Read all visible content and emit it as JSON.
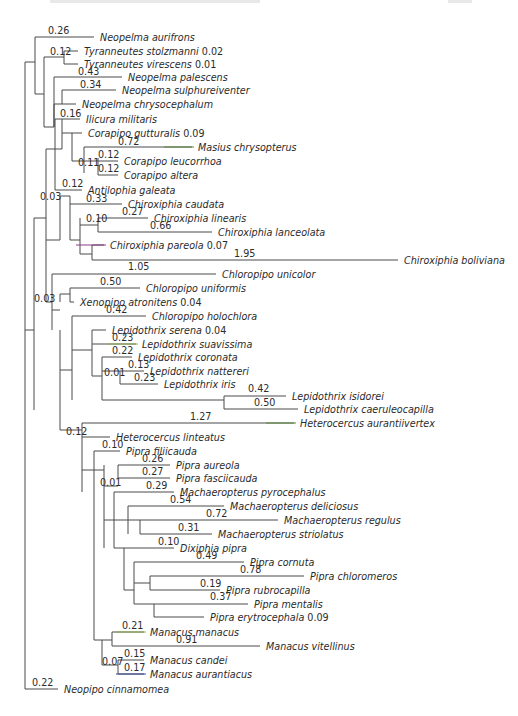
{
  "figure": {
    "type": "phylogenetic-tree",
    "colors": {
      "branch": "#4a4a4a",
      "text": "#2b2b2b",
      "green": "#5a8a3a",
      "purple": "#8a3a8a",
      "lime": "#8ab04a",
      "blue": "#3a4a9a"
    },
    "taxa": [
      {
        "id": "t1",
        "name": "Neopelma aurifrons",
        "x": 96,
        "y": 37,
        "label": "0.26",
        "lx": 48,
        "ly": 34
      },
      {
        "id": "t2",
        "name": "Tyranneutes stolzmanni",
        "x": 80,
        "y": 51,
        "suffix": "0.02",
        "label": "0.12",
        "lx": 50,
        "ly": 55
      },
      {
        "id": "t3",
        "name": "Tyranneutes virescens",
        "x": 80,
        "y": 64,
        "suffix": "0.01"
      },
      {
        "id": "t4",
        "name": "Neopelma palescens",
        "x": 124,
        "y": 77,
        "label": "0.43",
        "lx": 78,
        "ly": 75
      },
      {
        "id": "t5",
        "name": "Neopelma sulphureiventer",
        "x": 118,
        "y": 90,
        "label": "0.34",
        "lx": 80,
        "ly": 88
      },
      {
        "id": "t6",
        "name": "Neopelma chrysocephalum",
        "x": 78,
        "y": 104
      },
      {
        "id": "t7",
        "name": "Ilicura militaris",
        "x": 82,
        "y": 119,
        "label": "0.16",
        "lx": 60,
        "ly": 117
      },
      {
        "id": "t8",
        "name": "Corapipo gutturalis",
        "x": 84,
        "y": 133,
        "suffix": "0.09"
      },
      {
        "id": "t9",
        "name": "Masius chrysopterus",
        "x": 194,
        "y": 147,
        "label": "0.72",
        "lx": 118,
        "ly": 145,
        "color": "green"
      },
      {
        "id": "t10",
        "name": "Corapipo leucorrhoa",
        "x": 120,
        "y": 161,
        "label": "0.12",
        "lx": 98,
        "ly": 158
      },
      {
        "id": "t11",
        "name": "Corapipo altera",
        "x": 120,
        "y": 175,
        "label": "0.12",
        "lx": 98,
        "ly": 172
      },
      {
        "id": "t12",
        "name": "Antilophia galeata",
        "x": 84,
        "y": 190,
        "label": "0.12",
        "lx": 62,
        "ly": 187
      },
      {
        "id": "t13",
        "name": "Chiroxiphia caudata",
        "x": 124,
        "y": 204,
        "label": "0.33",
        "lx": 86,
        "ly": 202
      },
      {
        "id": "t14",
        "name": "Chiroxiphia linearis",
        "x": 150,
        "y": 218,
        "label": "0.27",
        "lx": 122,
        "ly": 215
      },
      {
        "id": "t15",
        "name": "Chiroxiphia lanceolata",
        "x": 214,
        "y": 232,
        "label": "0.66",
        "lx": 150,
        "ly": 229
      },
      {
        "id": "t16",
        "name": "Chiroxiphia pareola",
        "x": 106,
        "y": 245,
        "suffix": "0.07",
        "color": "purple"
      },
      {
        "id": "t17",
        "name": "Chiroxiphia boliviana",
        "x": 400,
        "y": 260,
        "label": "1.95",
        "lx": 234,
        "ly": 257
      },
      {
        "id": "t18",
        "name": "Chloropipo unicolor",
        "x": 218,
        "y": 274,
        "label": "1.05",
        "lx": 128,
        "ly": 270
      },
      {
        "id": "t19",
        "name": "Chloropipo uniformis",
        "x": 142,
        "y": 288,
        "label": "0.50",
        "lx": 100,
        "ly": 285
      },
      {
        "id": "t20",
        "name": "Xenopipo atronitens",
        "x": 76,
        "y": 302,
        "suffix": "0.04"
      },
      {
        "id": "t21",
        "name": "Chloropipo holochlora",
        "x": 148,
        "y": 316,
        "label": "0.42",
        "lx": 106,
        "ly": 313
      },
      {
        "id": "t22",
        "name": "Lepidothrix serena",
        "x": 108,
        "y": 330,
        "suffix": "0.04"
      },
      {
        "id": "t23",
        "name": "Lepidothrix suavissima",
        "x": 138,
        "y": 344,
        "label": "0.23",
        "lx": 112,
        "ly": 341,
        "color": "lime"
      },
      {
        "id": "t24",
        "name": "Lepidothrix coronata",
        "x": 134,
        "y": 357,
        "label": "0.22",
        "lx": 112,
        "ly": 354
      },
      {
        "id": "t25",
        "name": "Lepidothrix nattereri",
        "x": 146,
        "y": 371,
        "label": "0.13",
        "lx": 128,
        "ly": 368
      },
      {
        "id": "t26",
        "name": "Lepidothrix iris",
        "x": 160,
        "y": 384,
        "label": "0.23",
        "lx": 134,
        "ly": 381
      },
      {
        "id": "t27",
        "name": "Lepidothrix isidorei",
        "x": 288,
        "y": 396,
        "label": "0.42",
        "lx": 248,
        "ly": 392
      },
      {
        "id": "t28",
        "name": "Lepidothrix caeruleocapilla",
        "x": 300,
        "y": 409,
        "label": "0.50",
        "lx": 254,
        "ly": 406
      },
      {
        "id": "t29",
        "name": "Heterocercus aurantiivertex",
        "x": 296,
        "y": 423,
        "label": "1.27",
        "lx": 190,
        "ly": 420,
        "color": "green"
      },
      {
        "id": "t30",
        "name": "Heterocercus linteatus",
        "x": 112,
        "y": 437,
        "label": "0.12",
        "lx": 66,
        "ly": 435
      },
      {
        "id": "t31",
        "name": "Pipra filiicauda",
        "x": 122,
        "y": 451,
        "label": "0.10",
        "lx": 102,
        "ly": 448
      },
      {
        "id": "t32",
        "name": "Pipra aureola",
        "x": 172,
        "y": 465,
        "label": "0.26",
        "lx": 142,
        "ly": 462
      },
      {
        "id": "t33",
        "name": "Pipra fasciicauda",
        "x": 172,
        "y": 478,
        "label": "0.27",
        "lx": 142,
        "ly": 475
      },
      {
        "id": "t34",
        "name": "Machaeropterus pyrocephalus",
        "x": 176,
        "y": 492,
        "label": "0.29",
        "lx": 146,
        "ly": 489
      },
      {
        "id": "t35",
        "name": "Machaeropterus deliciosus",
        "x": 226,
        "y": 506,
        "label": "0.54",
        "lx": 170,
        "ly": 503
      },
      {
        "id": "t36",
        "name": "Machaeropterus regulus",
        "x": 280,
        "y": 520,
        "label": "0.72",
        "lx": 206,
        "ly": 517
      },
      {
        "id": "t37",
        "name": "Machaeropterus striolatus",
        "x": 214,
        "y": 534,
        "label": "0.31",
        "lx": 178,
        "ly": 531
      },
      {
        "id": "t38",
        "name": "Dixiphia pipra",
        "x": 176,
        "y": 548,
        "label": "0.10",
        "lx": 158,
        "ly": 545
      },
      {
        "id": "t39",
        "name": "Pipra cornuta",
        "x": 246,
        "y": 562,
        "label": "0.49",
        "lx": 196,
        "ly": 559
      },
      {
        "id": "t40",
        "name": "Pipra chloromeros",
        "x": 306,
        "y": 576,
        "label": "0.78",
        "lx": 240,
        "ly": 573
      },
      {
        "id": "t41",
        "name": "Pipra rubrocapilla",
        "x": 222,
        "y": 590,
        "label": "0.19",
        "lx": 200,
        "ly": 587
      },
      {
        "id": "t42",
        "name": "Pipra mentalis",
        "x": 250,
        "y": 604,
        "label": "0.37",
        "lx": 210,
        "ly": 600
      },
      {
        "id": "t43",
        "name": "Pipra erytrocephala",
        "x": 206,
        "y": 617,
        "suffix": "0.09"
      },
      {
        "id": "t44",
        "name": "Manacus manacus",
        "x": 146,
        "y": 632,
        "label": "0.21",
        "lx": 122,
        "ly": 629,
        "color": "lime"
      },
      {
        "id": "t45",
        "name": "Manacus vitellinus",
        "x": 262,
        "y": 646,
        "label": "0.91",
        "lx": 176,
        "ly": 643
      },
      {
        "id": "t46",
        "name": "Manacus candei",
        "x": 146,
        "y": 660,
        "label": "0.15",
        "lx": 124,
        "ly": 657
      },
      {
        "id": "t47",
        "name": "Manacus aurantiacus",
        "x": 146,
        "y": 674,
        "label": "0.17",
        "lx": 124,
        "ly": 671,
        "color": "blue"
      },
      {
        "id": "t48",
        "name": "Neopipo cinnamomea",
        "x": 60,
        "y": 689,
        "label": "0.22",
        "lx": 32,
        "ly": 686
      }
    ],
    "internal_labels": [
      {
        "text": "0.03",
        "x": 40,
        "y": 200
      },
      {
        "text": "0.03",
        "x": 34,
        "y": 302
      },
      {
        "text": "0.11",
        "x": 78,
        "y": 166
      },
      {
        "text": "0.10",
        "x": 86,
        "y": 222
      },
      {
        "text": "0.01",
        "x": 104,
        "y": 376
      },
      {
        "text": "0.01",
        "x": 100,
        "y": 486
      },
      {
        "text": "0.07",
        "x": 102,
        "y": 665
      }
    ]
  }
}
